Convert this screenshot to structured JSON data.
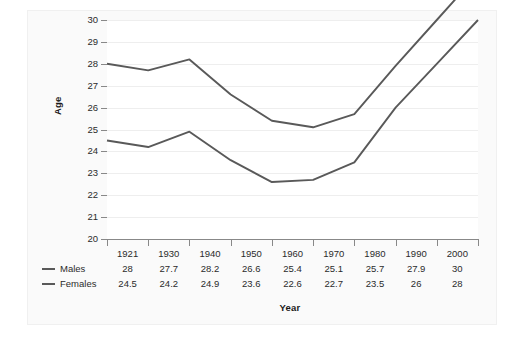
{
  "chart_data": {
    "type": "line",
    "title": "",
    "xlabel": "Year",
    "ylabel": "Age",
    "categories": [
      "1921",
      "1930",
      "1940",
      "1950",
      "1960",
      "1970",
      "1980",
      "1990",
      "2000"
    ],
    "series": [
      {
        "name": "Males",
        "values": [
          28,
          27.7,
          28.2,
          26.6,
          25.4,
          25.1,
          25.7,
          27.9,
          30
        ]
      },
      {
        "name": "Females",
        "values": [
          24.5,
          24.2,
          24.9,
          23.6,
          22.6,
          22.7,
          23.5,
          26,
          28
        ]
      }
    ],
    "ylim": [
      20,
      30
    ],
    "yticks": [
      30,
      29,
      28,
      27,
      26,
      25,
      24,
      23,
      22,
      21,
      20
    ],
    "grid": true,
    "legend_position": "bottom-left",
    "line_color": "#595959",
    "grid_color": "#eeeeee",
    "axis_color": "#888888",
    "text_color": "#2b2b2b",
    "panel_background": "#fafafa",
    "plot_background": "#ffffff"
  },
  "table": {
    "legend_column_header": "",
    "series_labels": [
      "Males",
      "Females"
    ]
  }
}
